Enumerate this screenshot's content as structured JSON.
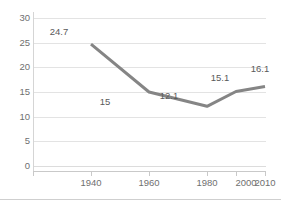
{
  "chart_data": {
    "type": "line",
    "title": "",
    "xlabel": "",
    "ylabel": "",
    "categories": [
      "1940",
      "1960",
      "1980",
      "2000",
      "2010"
    ],
    "x": [
      1940,
      1960,
      1980,
      2000,
      2010
    ],
    "values": [
      24.7,
      15,
      12.1,
      15.1,
      16.1
    ],
    "point_labels": [
      "24.7",
      "15",
      "12.1",
      "15.1",
      "16.1"
    ],
    "series": [
      {
        "name": "",
        "values": [
          24.7,
          15,
          12.1,
          15.1,
          16.1
        ]
      }
    ],
    "ylim": [
      0,
      30
    ],
    "ytick_labels": [
      "0",
      "5",
      "10",
      "15",
      "20",
      "25",
      "30"
    ],
    "ytick_values": [
      0,
      5,
      10,
      15,
      20,
      25,
      30
    ],
    "xtick_labels": [
      "1940",
      "1960",
      "1980",
      "2000",
      "2010"
    ],
    "grid": "horizontal",
    "legend": "none",
    "line_color": "#858585",
    "gridline_color": "#e3e3e3",
    "axis_color": "#c9c9c9",
    "tick_label_color": "#6f6f6f",
    "data_label_color": "#5a5a5a",
    "background_color": "#ffffff"
  }
}
